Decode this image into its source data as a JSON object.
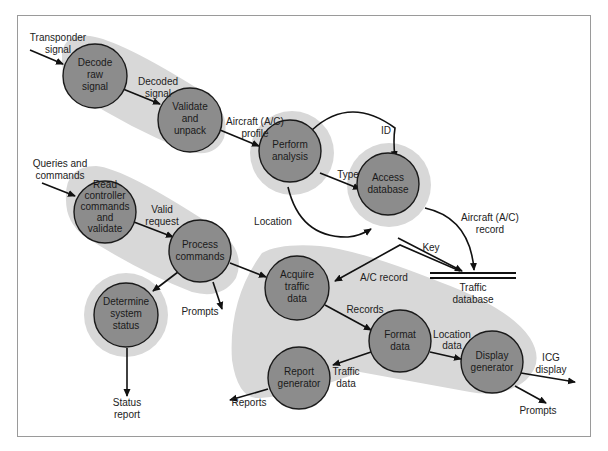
{
  "diagram": {
    "type": "data-flow-diagram",
    "colors": {
      "process_fill": "#8c8c8c",
      "process_stroke": "#1a1a1a",
      "halo": "#d8d8d8",
      "arrow": "#111111",
      "frame": "#9a9a9a"
    },
    "processes": [
      {
        "id": "decode",
        "lines": [
          "Decode",
          "raw",
          "signal"
        ]
      },
      {
        "id": "validate",
        "lines": [
          "Validate",
          "and",
          "unpack"
        ]
      },
      {
        "id": "analysis",
        "lines": [
          "Perform",
          "analysis"
        ]
      },
      {
        "id": "access",
        "lines": [
          "Access",
          "database"
        ]
      },
      {
        "id": "read",
        "lines": [
          "Read",
          "controller",
          "commands",
          "and",
          "validate"
        ]
      },
      {
        "id": "process",
        "lines": [
          "Process",
          "commands"
        ]
      },
      {
        "id": "status",
        "lines": [
          "Determine",
          "system",
          "status"
        ]
      },
      {
        "id": "acquire",
        "lines": [
          "Acquire",
          "traffic",
          "data"
        ]
      },
      {
        "id": "format",
        "lines": [
          "Format",
          "data"
        ]
      },
      {
        "id": "report",
        "lines": [
          "Report",
          "generator"
        ]
      },
      {
        "id": "display",
        "lines": [
          "Display",
          "generator"
        ]
      }
    ],
    "data_store": {
      "id": "traffic-db",
      "lines": [
        "Traffic",
        "database"
      ]
    },
    "flows": [
      {
        "id": "transponder",
        "lines": [
          "Transponder",
          "signal"
        ]
      },
      {
        "id": "decoded",
        "lines": [
          "Decoded",
          "signal"
        ]
      },
      {
        "id": "profile",
        "lines": [
          "Aircraft (A/C)",
          "profile"
        ]
      },
      {
        "id": "id",
        "lines": [
          "ID"
        ]
      },
      {
        "id": "type",
        "lines": [
          "Type"
        ]
      },
      {
        "id": "location",
        "lines": [
          "Location"
        ]
      },
      {
        "id": "ac-record",
        "lines": [
          "Aircraft (A/C)",
          "record"
        ]
      },
      {
        "id": "key",
        "lines": [
          "Key"
        ]
      },
      {
        "id": "ac-record2",
        "lines": [
          "A/C record"
        ]
      },
      {
        "id": "queries",
        "lines": [
          "Queries and",
          "commands"
        ]
      },
      {
        "id": "valid-request",
        "lines": [
          "Valid",
          "request"
        ]
      },
      {
        "id": "prompts1",
        "lines": [
          "Prompts"
        ]
      },
      {
        "id": "status-report",
        "lines": [
          "Status",
          "report"
        ]
      },
      {
        "id": "records",
        "lines": [
          "Records"
        ]
      },
      {
        "id": "location-data",
        "lines": [
          "Location",
          "data"
        ]
      },
      {
        "id": "traffic-data",
        "lines": [
          "Traffic",
          "data"
        ]
      },
      {
        "id": "reports",
        "lines": [
          "Reports"
        ]
      },
      {
        "id": "icg",
        "lines": [
          "ICG",
          "display"
        ]
      },
      {
        "id": "prompts2",
        "lines": [
          "Prompts"
        ]
      }
    ]
  }
}
